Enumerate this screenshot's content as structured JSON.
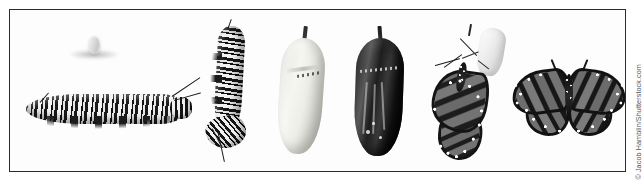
{
  "figure": {
    "rendering": "black-and-white photographic plate",
    "frame": {
      "border_color": "#2b2b2b",
      "background_color": "#fdfdfd"
    },
    "page_background": "#ffffff"
  },
  "credit": {
    "text": "© Jacob Hamblin/Shutterstock.com",
    "color": "#55585c",
    "orientation": "vertical-right-edge"
  },
  "stages": [
    {
      "index": 1,
      "name": "egg-on-leaf",
      "label": "Egg",
      "description": "Pale out-of-focus egg resting on a blurred milkweed leaf surface"
    },
    {
      "index": 2,
      "name": "caterpillar-horizontal",
      "label": "Larva (caterpillar)",
      "description": "Full-grown black, white and pale striped monarch caterpillar crawling horizontally with filaments at both ends"
    },
    {
      "index": 3,
      "name": "caterpillar-j-hang",
      "label": "Pre-pupa (J-hang)",
      "description": "Striped caterpillar hanging vertically in a J shape from a silk pad, about to pupate"
    },
    {
      "index": 4,
      "name": "chrysalis-fresh",
      "label": "Chrysalis (fresh)",
      "description": "Smooth pale chrysalis with a dark cremaster stalk and a band of small metallic dots"
    },
    {
      "index": 5,
      "name": "chrysalis-mature",
      "label": "Chrysalis (mature)",
      "description": "Darkened, nearly black chrysalis with the folded wing pattern showing through the transparent cuticle"
    },
    {
      "index": 6,
      "name": "butterfly-emerging",
      "label": "Emerging adult",
      "description": "Newly eclosed monarch hanging with closed, still-expanding wings beneath the empty translucent chrysalis shell"
    },
    {
      "index": 7,
      "name": "butterfly-adult",
      "label": "Adult butterfly",
      "description": "Fully formed monarch butterfly with wings spread open, showing veined wings bordered by white spots"
    }
  ]
}
